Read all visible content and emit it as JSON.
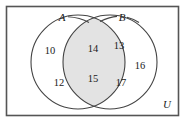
{
  "figure": {
    "kind": "venn-diagram",
    "universe_label": "U",
    "set_labels": {
      "left": "A",
      "right": "B"
    },
    "regions": {
      "left_only": [
        "10",
        "12"
      ],
      "intersection": [
        "14",
        "15"
      ],
      "right_only": [
        "13",
        "16",
        "17"
      ]
    },
    "elements": {
      "a_only_top": "10",
      "a_only_bottom": "12",
      "intersection_top": "14",
      "intersection_bottom": "15",
      "b_only_top": "13",
      "b_only_right": "16",
      "b_only_bottom": "17"
    }
  },
  "colors": {
    "frame_stroke": "#555555",
    "circle_stroke": "#444444",
    "intersection_fill": "#e3e3e3",
    "text": "#1a1a1a",
    "background": "#ffffff"
  }
}
